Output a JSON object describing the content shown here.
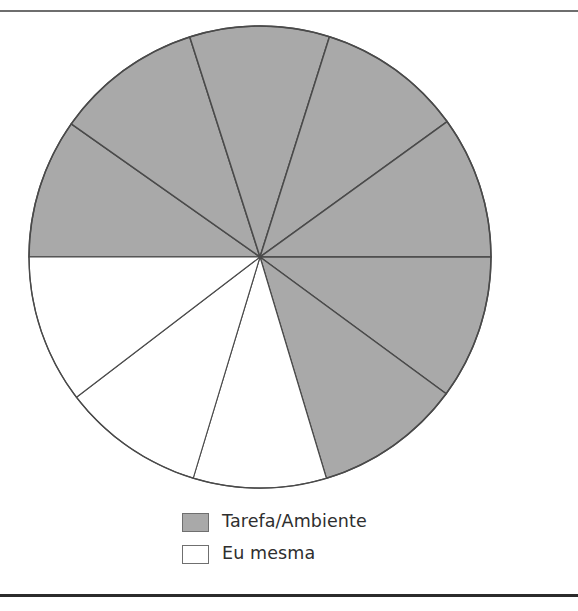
{
  "figure": {
    "background_color": "#ffffff",
    "rule_top_color": "#6e6e6e",
    "rule_bottom_color": "#2b2b2b"
  },
  "legend": {
    "position": "bottom-center",
    "items": [
      {
        "label": "Tarefa/Ambiente",
        "color": "#a9a9a9",
        "swatch_name": "legend-swatch-tarefa-ambiente"
      },
      {
        "label": "Eu mesma",
        "color": "#ffffff",
        "swatch_name": "legend-swatch-eu-mesma"
      }
    ]
  },
  "chart_data": {
    "type": "pie",
    "title": "",
    "xlabel": "",
    "ylabel": "",
    "grid": false,
    "legend_position": "bottom-center",
    "start_angle_deg": 270,
    "direction": "clockwise",
    "center": {
      "x": 260,
      "y": 257
    },
    "radius": 231,
    "stroke_color": "#4a4a4a",
    "categories": [
      "Tarefa/Ambiente",
      "Eu mesma"
    ],
    "category_colors": {
      "Tarefa/Ambiente": "#a9a9a9",
      "Eu mesma": "#ffffff"
    },
    "values": [
      253.3,
      106.7
    ],
    "percentages": [
      70.4,
      29.6
    ],
    "slices": [
      {
        "index": 1,
        "category": "Tarefa/Ambiente",
        "color": "#a9a9a9",
        "start_deg": 270.0,
        "end_deg": 305.2,
        "sweep_deg": 35.2,
        "percent": 9.8
      },
      {
        "index": 2,
        "category": "Tarefa/Ambiente",
        "color": "#a9a9a9",
        "start_deg": 305.2,
        "end_deg": 342.3,
        "sweep_deg": 37.1,
        "percent": 10.3
      },
      {
        "index": 3,
        "category": "Tarefa/Ambiente",
        "color": "#a9a9a9",
        "start_deg": 342.3,
        "end_deg": 17.5,
        "sweep_deg": 35.2,
        "percent": 9.8
      },
      {
        "index": 4,
        "category": "Tarefa/Ambiente",
        "color": "#a9a9a9",
        "start_deg": 17.5,
        "end_deg": 54.1,
        "sweep_deg": 36.6,
        "percent": 10.2
      },
      {
        "index": 5,
        "category": "Tarefa/Ambiente",
        "color": "#a9a9a9",
        "start_deg": 54.1,
        "end_deg": 90.0,
        "sweep_deg": 35.9,
        "percent": 10.0
      },
      {
        "index": 6,
        "category": "Tarefa/Ambiente",
        "color": "#a9a9a9",
        "start_deg": 90.0,
        "end_deg": 126.3,
        "sweep_deg": 36.3,
        "percent": 10.1
      },
      {
        "index": 7,
        "category": "Tarefa/Ambiente",
        "color": "#a9a9a9",
        "start_deg": 126.3,
        "end_deg": 163.3,
        "sweep_deg": 37.0,
        "percent": 10.3
      },
      {
        "index": 8,
        "category": "Eu mesma",
        "color": "#ffffff",
        "start_deg": 163.3,
        "end_deg": 196.8,
        "sweep_deg": 33.5,
        "percent": 9.3
      },
      {
        "index": 9,
        "category": "Eu mesma",
        "color": "#ffffff",
        "start_deg": 196.8,
        "end_deg": 232.6,
        "sweep_deg": 35.8,
        "percent": 9.9
      },
      {
        "index": 10,
        "category": "Eu mesma",
        "color": "#ffffff",
        "start_deg": 232.6,
        "end_deg": 270.0,
        "sweep_deg": 37.4,
        "percent": 10.4
      }
    ]
  }
}
